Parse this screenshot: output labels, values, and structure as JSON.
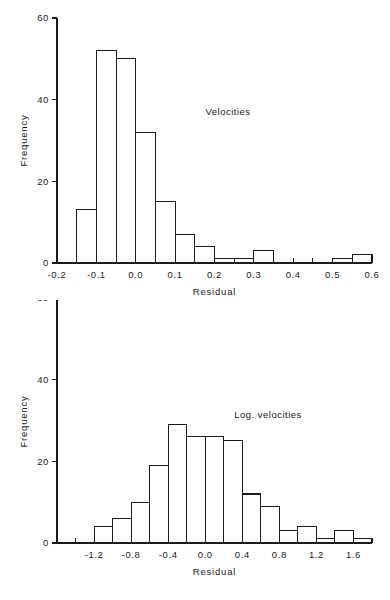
{
  "figure": {
    "title": "",
    "background": "#ffffff",
    "ink_color": "#1a1a1a"
  },
  "chart_data": [
    {
      "type": "bar",
      "id": "velocities-histogram",
      "title": "",
      "annotation": "Velocities",
      "xlabel": "Residual",
      "ylabel": "Frequency",
      "xlim": [
        -0.2,
        0.6
      ],
      "ylim": [
        0,
        60
      ],
      "grid": false,
      "legend": null,
      "bin_width": 0.05,
      "x_major_ticks": [
        -0.2,
        -0.1,
        0.0,
        0.1,
        0.2,
        0.3,
        0.4,
        0.5,
        0.6
      ],
      "x_major_tick_labels": [
        "-0.2",
        "-0.1",
        "0.0",
        "0.1",
        "0.2",
        "0.3",
        "0.4",
        "0.5",
        "0.6"
      ],
      "x_minor_tick_step": 0.05,
      "y_ticks": [
        0,
        20,
        40,
        60
      ],
      "y_tick_labels": [
        "0",
        "20",
        "40",
        "60"
      ],
      "bin_edges": [
        -0.15,
        -0.1,
        -0.05,
        0.0,
        0.05,
        0.1,
        0.15,
        0.2,
        0.25,
        0.3,
        0.35,
        0.4,
        0.45,
        0.5,
        0.55,
        0.6
      ],
      "categories": [
        "-0.15..-0.10",
        "-0.10..-0.05",
        "-0.05..0.00",
        "0.00..0.05",
        "0.05..0.10",
        "0.10..0.15",
        "0.15..0.20",
        "0.20..0.25",
        "0.25..0.30",
        "0.30..0.35",
        "0.35..0.40",
        "0.40..0.45",
        "0.45..0.50",
        "0.50..0.55",
        "0.55..0.60"
      ],
      "values": [
        13,
        52,
        50,
        32,
        15,
        7,
        4,
        1,
        1,
        3,
        0,
        0,
        0,
        1,
        2
      ]
    },
    {
      "type": "bar",
      "id": "log-velocities-histogram",
      "title": "",
      "annotation": "Log. velocities",
      "xlabel": "Residual",
      "ylabel": "Frequency",
      "xlim": [
        -1.6,
        1.8
      ],
      "ylim": [
        0,
        60
      ],
      "grid": false,
      "legend": null,
      "bin_width": 0.2,
      "x_major_ticks": [
        -1.2,
        -0.8,
        -0.4,
        0.0,
        0.4,
        0.8,
        1.2,
        1.6
      ],
      "x_major_tick_labels": [
        "-1.2",
        "-0.8",
        "-0.4",
        "0.0",
        "0.4",
        "0.8",
        "1.2",
        "1.6"
      ],
      "x_minor_tick_step": 0.2,
      "y_ticks": [
        0,
        20,
        40,
        60
      ],
      "y_tick_labels": [
        "0",
        "20",
        "40",
        "60"
      ],
      "bin_edges": [
        -1.2,
        -1.0,
        -0.8,
        -0.6,
        -0.4,
        -0.2,
        0.0,
        0.2,
        0.4,
        0.6,
        0.8,
        1.0,
        1.2,
        1.4,
        1.6,
        1.8
      ],
      "categories": [
        "-1.2..-1.0",
        "-1.0..-0.8",
        "-0.8..-0.6",
        "-0.6..-0.4",
        "-0.4..-0.2",
        "-0.2..0.0",
        "0.0..0.2",
        "0.2..0.4",
        "0.4..0.6",
        "0.6..0.8",
        "0.8..1.0",
        "1.0..1.2",
        "1.2..1.4",
        "1.4..1.6",
        "1.6..1.8"
      ],
      "values": [
        4,
        6,
        10,
        19,
        29,
        26,
        26,
        25,
        12,
        9,
        3,
        4,
        1,
        3,
        1
      ]
    }
  ]
}
